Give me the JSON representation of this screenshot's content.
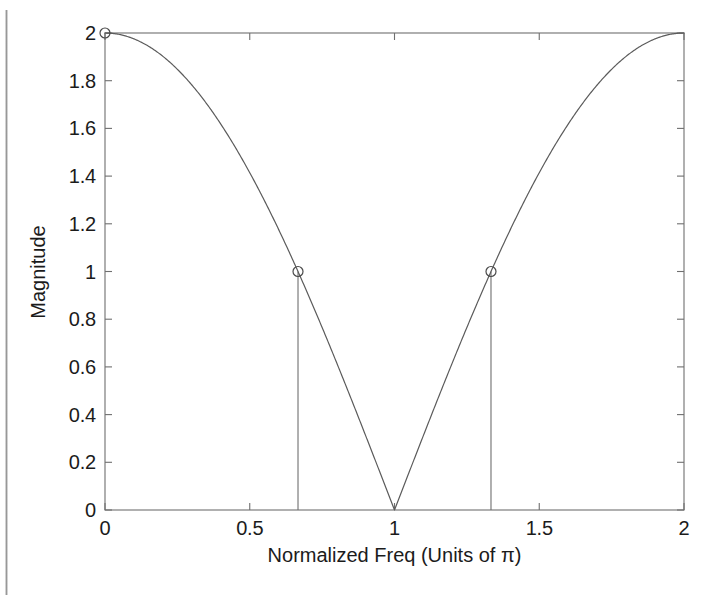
{
  "figure": {
    "background_color": "#ffffff",
    "axis_color": "#6f6f6f",
    "curve_color": "#5b5b5b",
    "text_color": "#1b1b1b",
    "scan_artifact_color": "#9a9a9a"
  },
  "chart_data": {
    "type": "line",
    "title": "",
    "subtitle": "",
    "xlabel": "Normalized Freq (Units of π)",
    "ylabel": "Magnitude",
    "xlim": [
      0,
      2
    ],
    "ylim": [
      0,
      2
    ],
    "xticks": [
      0,
      0.5,
      1,
      1.5,
      2
    ],
    "xtick_labels": [
      "0",
      "0.5",
      "1",
      "1.5",
      "2"
    ],
    "yticks": [
      0,
      0.2,
      0.4,
      0.6,
      0.8,
      1,
      1.2,
      1.4,
      1.6,
      1.8,
      2
    ],
    "ytick_labels": [
      "0",
      "0.2",
      "0.4",
      "0.6",
      "0.8",
      "1",
      "1.2",
      "1.4",
      "1.6",
      "1.8",
      "2"
    ],
    "grid": false,
    "legend": null,
    "legend_position": "none",
    "box": true,
    "tick_direction": "in",
    "series": [
      {
        "name": "Magnitude response",
        "formula": "2*abs(cos(pi*f/2))",
        "style": "solid",
        "x": [
          0,
          0.05,
          0.1,
          0.15,
          0.2,
          0.25,
          0.3,
          0.35,
          0.4,
          0.45,
          0.5,
          0.55,
          0.6,
          0.65,
          0.7,
          0.75,
          0.8,
          0.85,
          0.9,
          0.95,
          1,
          1.05,
          1.1,
          1.15,
          1.2,
          1.25,
          1.3,
          1.35,
          1.4,
          1.45,
          1.5,
          1.55,
          1.6,
          1.65,
          1.7,
          1.75,
          1.8,
          1.85,
          1.9,
          1.95,
          2
        ],
        "y": [
          2,
          1.994,
          1.975,
          1.945,
          1.902,
          1.848,
          1.782,
          1.705,
          1.618,
          1.52,
          1.414,
          1.299,
          1.176,
          1.045,
          0.908,
          0.765,
          0.618,
          0.467,
          0.313,
          0.157,
          0,
          0.157,
          0.313,
          0.467,
          0.618,
          0.765,
          0.908,
          1.045,
          1.176,
          1.299,
          1.414,
          1.52,
          1.618,
          1.705,
          1.782,
          1.848,
          1.902,
          1.945,
          1.975,
          1.994,
          2
        ]
      }
    ],
    "markers": [
      {
        "x": 0,
        "y": 2,
        "shape": "circle",
        "label": "endpoint marker at DC"
      },
      {
        "x": 0.6667,
        "y": 1,
        "shape": "circle",
        "label": "half-magnitude point"
      },
      {
        "x": 1.3333,
        "y": 1,
        "shape": "circle",
        "label": "half-magnitude point"
      }
    ],
    "stems": [
      {
        "x": 0.6667,
        "y_top": 1,
        "y_bottom": 0
      },
      {
        "x": 1.3333,
        "y_top": 1,
        "y_bottom": 0
      }
    ],
    "annotations": [
      {
        "text": "zero at f = 0.5",
        "x": 0.5,
        "y": 0
      },
      {
        "text": "zero at f = 1.5",
        "x": 1.5,
        "y": 0
      },
      {
        "text": "peak at f = 1",
        "x": 1,
        "y": 2
      }
    ]
  },
  "geometry": {
    "plot_left": 105,
    "plot_right": 684,
    "plot_top": 33,
    "plot_bottom": 510
  }
}
